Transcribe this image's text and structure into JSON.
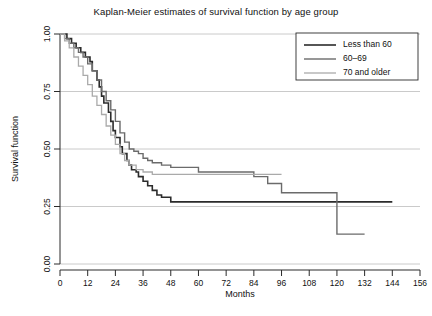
{
  "chart_data": {
    "type": "line",
    "title": "Kaplan-Meier estimates of survival function by age group",
    "xlabel": "Months",
    "ylabel": "Survival function",
    "xlim": [
      0,
      156
    ],
    "ylim": [
      0,
      1.0
    ],
    "xticks": [
      0,
      12,
      24,
      36,
      48,
      60,
      72,
      84,
      96,
      108,
      120,
      132,
      144,
      156
    ],
    "xtick_labels": [
      "0",
      "12",
      "24",
      "36",
      "48",
      "60",
      "72",
      "84",
      "96",
      "108",
      "120",
      "132",
      "144",
      "156"
    ],
    "yticks": [
      0.0,
      0.25,
      0.5,
      0.75,
      1.0
    ],
    "ytick_labels": [
      "0.00",
      "0.25",
      "0.50",
      "0.75",
      "1.00"
    ],
    "grid": "horizontal",
    "step_type": "post",
    "legend_position": "top-right",
    "series": [
      {
        "name": "Less than 60",
        "color": "#2b2b2b",
        "linewidth": 1.6,
        "x": [
          0,
          3,
          5,
          7,
          9,
          11,
          13,
          14,
          16,
          17,
          18,
          19,
          21,
          22,
          23,
          24,
          26,
          27,
          29,
          30,
          31,
          33,
          34,
          36,
          38,
          40,
          42,
          44,
          48,
          96,
          144
        ],
        "y": [
          1.0,
          0.98,
          0.96,
          0.94,
          0.92,
          0.9,
          0.88,
          0.84,
          0.8,
          0.77,
          0.73,
          0.7,
          0.66,
          0.62,
          0.58,
          0.55,
          0.51,
          0.48,
          0.45,
          0.43,
          0.41,
          0.4,
          0.38,
          0.36,
          0.34,
          0.32,
          0.3,
          0.29,
          0.27,
          0.27,
          0.27
        ]
      },
      {
        "name": "60–69",
        "color": "#6b6b6b",
        "linewidth": 1.4,
        "x": [
          0,
          2,
          4,
          6,
          8,
          10,
          12,
          14,
          16,
          18,
          20,
          22,
          24,
          26,
          28,
          30,
          32,
          34,
          36,
          38,
          40,
          44,
          48,
          60,
          84,
          90,
          96,
          120,
          132
        ],
        "y": [
          1.0,
          0.98,
          0.96,
          0.94,
          0.92,
          0.9,
          0.87,
          0.84,
          0.8,
          0.75,
          0.71,
          0.67,
          0.62,
          0.57,
          0.53,
          0.5,
          0.49,
          0.48,
          0.46,
          0.45,
          0.44,
          0.43,
          0.42,
          0.4,
          0.38,
          0.35,
          0.31,
          0.13,
          0.13
        ]
      },
      {
        "name": "70 and older",
        "color": "#aaaaaa",
        "linewidth": 1.3,
        "x": [
          0,
          2,
          4,
          6,
          8,
          10,
          12,
          14,
          16,
          18,
          20,
          22,
          24,
          26,
          28,
          30,
          33,
          36,
          40,
          44,
          48,
          56,
          64,
          96
        ],
        "y": [
          1.0,
          0.97,
          0.94,
          0.9,
          0.86,
          0.82,
          0.78,
          0.73,
          0.69,
          0.65,
          0.6,
          0.56,
          0.52,
          0.48,
          0.45,
          0.43,
          0.41,
          0.4,
          0.39,
          0.39,
          0.39,
          0.39,
          0.39,
          0.39
        ]
      }
    ]
  },
  "legend": {
    "items": [
      {
        "label": "Less than 60"
      },
      {
        "label": "60–69"
      },
      {
        "label": "70 and older"
      }
    ]
  }
}
